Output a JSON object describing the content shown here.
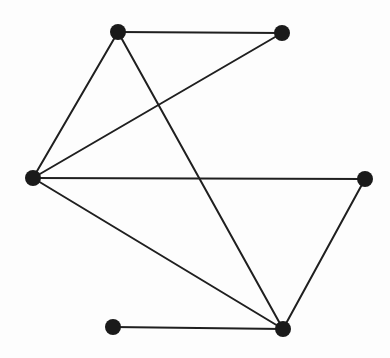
{
  "graph": {
    "width": 390,
    "height": 358,
    "node_color": "#1a1a1a",
    "edge_color": "#1f1f1f",
    "edge_width": 2,
    "node_radius": 8,
    "nodes": [
      {
        "id": "top-left",
        "x": 118,
        "y": 32
      },
      {
        "id": "top-right",
        "x": 282,
        "y": 33
      },
      {
        "id": "left",
        "x": 33,
        "y": 178
      },
      {
        "id": "right",
        "x": 365,
        "y": 179
      },
      {
        "id": "bottom-left",
        "x": 113,
        "y": 327
      },
      {
        "id": "bottom-right",
        "x": 283,
        "y": 329
      }
    ],
    "edges": [
      {
        "from": "top-left",
        "to": "top-right"
      },
      {
        "from": "top-left",
        "to": "left"
      },
      {
        "from": "top-left",
        "to": "bottom-right"
      },
      {
        "from": "top-right",
        "to": "left"
      },
      {
        "from": "left",
        "to": "right"
      },
      {
        "from": "left",
        "to": "bottom-right"
      },
      {
        "from": "right",
        "to": "bottom-right"
      },
      {
        "from": "bottom-left",
        "to": "bottom-right"
      }
    ]
  }
}
